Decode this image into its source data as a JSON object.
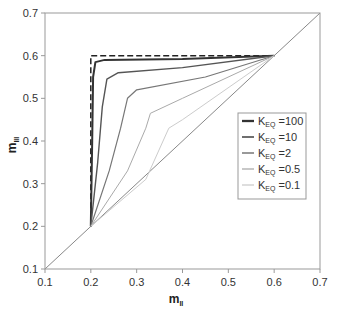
{
  "chart_data": {
    "type": "line",
    "title": "",
    "xlabel": "m_II",
    "ylabel": "m_III",
    "xlim": [
      0.1,
      0.7
    ],
    "ylim": [
      0.1,
      0.7
    ],
    "xticks": [
      "0.1",
      "0.2",
      "0.3",
      "0.4",
      "0.5",
      "0.6",
      "0.7"
    ],
    "yticks": [
      "0.1",
      "0.2",
      "0.3",
      "0.4",
      "0.5",
      "0.6",
      "0.7"
    ],
    "grid": false,
    "legend_position": "lower right inside",
    "reference_lines": [
      {
        "name": "diagonal",
        "style": "solid",
        "color": "#888888",
        "points": [
          [
            0.1,
            0.1
          ],
          [
            0.7,
            0.7
          ]
        ]
      },
      {
        "name": "limit",
        "style": "dashed",
        "color": "#222222",
        "points": [
          [
            0.2,
            0.2
          ],
          [
            0.2,
            0.6
          ],
          [
            0.6,
            0.6
          ]
        ]
      }
    ],
    "series": [
      {
        "name": "K_EQ =100",
        "color": "#333333",
        "width": 2.0,
        "points": [
          [
            0.2,
            0.2
          ],
          [
            0.203,
            0.4
          ],
          [
            0.205,
            0.55
          ],
          [
            0.21,
            0.585
          ],
          [
            0.23,
            0.59
          ],
          [
            0.4,
            0.592
          ],
          [
            0.6,
            0.6
          ]
        ]
      },
      {
        "name": "K_EQ =10",
        "color": "#555555",
        "width": 1.4,
        "points": [
          [
            0.2,
            0.2
          ],
          [
            0.215,
            0.35
          ],
          [
            0.225,
            0.48
          ],
          [
            0.235,
            0.545
          ],
          [
            0.26,
            0.56
          ],
          [
            0.4,
            0.572
          ],
          [
            0.6,
            0.6
          ]
        ]
      },
      {
        "name": "K_EQ =2",
        "color": "#777777",
        "width": 1.2,
        "points": [
          [
            0.2,
            0.2
          ],
          [
            0.24,
            0.33
          ],
          [
            0.265,
            0.43
          ],
          [
            0.28,
            0.5
          ],
          [
            0.3,
            0.52
          ],
          [
            0.45,
            0.55
          ],
          [
            0.6,
            0.6
          ]
        ]
      },
      {
        "name": "K_EQ =0.5",
        "color": "#aaaaaa",
        "width": 1.0,
        "points": [
          [
            0.2,
            0.2
          ],
          [
            0.28,
            0.33
          ],
          [
            0.32,
            0.43
          ],
          [
            0.33,
            0.465
          ],
          [
            0.4,
            0.5
          ],
          [
            0.6,
            0.6
          ]
        ]
      },
      {
        "name": "K_EQ =0.1",
        "color": "#cccccc",
        "width": 1.0,
        "points": [
          [
            0.2,
            0.2
          ],
          [
            0.32,
            0.31
          ],
          [
            0.37,
            0.43
          ],
          [
            0.4,
            0.45
          ],
          [
            0.6,
            0.6
          ]
        ]
      }
    ]
  },
  "labels": {
    "x_main": "m",
    "x_sub": "II",
    "y_main": "m",
    "y_sub": "III",
    "legend": [
      {
        "main": "K",
        "sub": "EQ",
        "rest": " =100"
      },
      {
        "main": "K",
        "sub": "EQ",
        "rest": " =10"
      },
      {
        "main": "K",
        "sub": "EQ",
        "rest": " =2"
      },
      {
        "main": "K",
        "sub": "EQ",
        "rest": " =0.5"
      },
      {
        "main": "K",
        "sub": "EQ",
        "rest": " =0.1"
      }
    ]
  }
}
